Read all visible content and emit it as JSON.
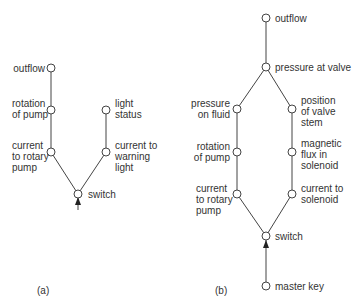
{
  "diagram_a": {
    "caption": "(a)",
    "nodes": {
      "outflow": "outflow",
      "rotation_of_pump": "rotation\nof pump",
      "current_to_rotary_pump": "current\nto rotary\npump",
      "switch": "switch",
      "light_status": "light\nstatus",
      "current_to_warning_light": "current to\nwarning\nlight"
    }
  },
  "diagram_b": {
    "caption": "(b)",
    "nodes": {
      "outflow": "outflow",
      "pressure_at_valve": "pressure at valve",
      "pressure_on_fluid": "pressure\non fluid",
      "position_of_valve_stem": "position\nof valve\nstem",
      "rotation_of_pump": "rotation\nof pump",
      "magnetic_flux_in_solenoid": "magnetic\nflux in\nsolenoid",
      "current_to_rotary_pump": "current\nto rotary\npump",
      "current_to_solenoid": "current to\nsolenoid",
      "switch": "switch",
      "master_key": "master key"
    }
  }
}
